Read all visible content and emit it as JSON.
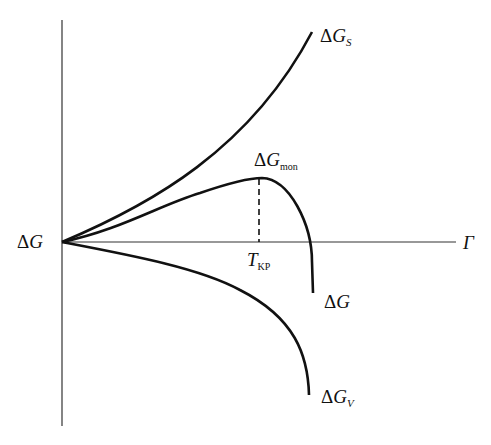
{
  "diagram": {
    "type": "thermodynamic-curves",
    "axes": {
      "vertical_label_prefix": "Δ",
      "vertical_label_main": "G",
      "horizontal_label": "Γ"
    },
    "curves": [
      {
        "id": "surface",
        "prefix": "Δ",
        "main": "G",
        "sub": "S",
        "description": "upper rising curve"
      },
      {
        "id": "total",
        "prefix": "Δ",
        "main": "G",
        "sub": "mon",
        "description": "maximum of resulting curve"
      },
      {
        "id": "resulting",
        "prefix": "Δ",
        "main": "G",
        "sub": "",
        "description": "resulting curve falling below axis"
      },
      {
        "id": "volume",
        "prefix": "Δ",
        "main": "G",
        "sub": "V",
        "description": "lower falling curve"
      }
    ],
    "critical_point": {
      "main": "T",
      "sub": "KP"
    },
    "colors": {
      "line": "#111111",
      "background": "#ffffff"
    }
  }
}
